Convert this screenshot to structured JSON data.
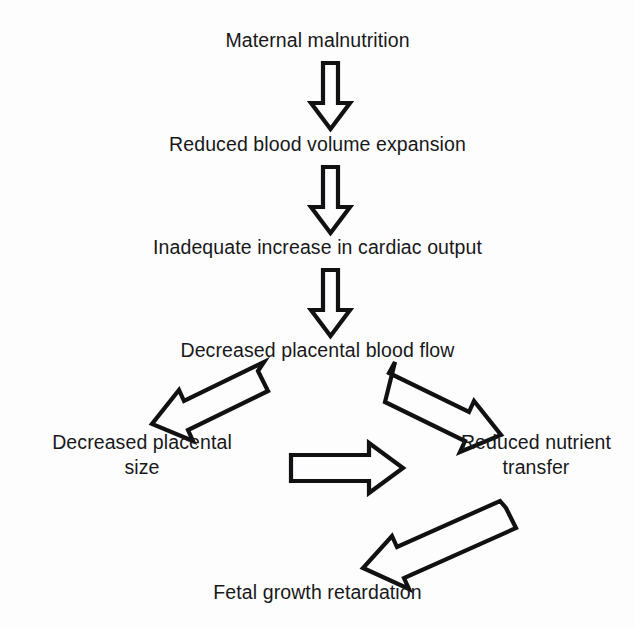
{
  "diagram": {
    "type": "flowchart",
    "background_color": "#fdfdfd",
    "line_color": "#111113",
    "text_color": "#18181a",
    "nodes": [
      {
        "id": "n1",
        "label": "Maternal malnutrition"
      },
      {
        "id": "n2",
        "label": "Reduced blood volume expansion"
      },
      {
        "id": "n3",
        "label": "Inadequate increase in cardiac output"
      },
      {
        "id": "n4",
        "label": "Decreased placental blood flow"
      },
      {
        "id": "n5",
        "label": "Decreased placental\nsize"
      },
      {
        "id": "n6",
        "label": "Reduced nutrient\ntransfer"
      },
      {
        "id": "n7",
        "label": "Fetal growth retardation"
      }
    ],
    "edges": [
      {
        "from": "n1",
        "to": "n2",
        "direction": "down"
      },
      {
        "from": "n2",
        "to": "n3",
        "direction": "down"
      },
      {
        "from": "n3",
        "to": "n4",
        "direction": "down"
      },
      {
        "from": "n4",
        "to": "n5",
        "direction": "down-left"
      },
      {
        "from": "n4",
        "to": "n6",
        "direction": "down-right"
      },
      {
        "from": "n5",
        "to": "n6",
        "direction": "right"
      },
      {
        "from": "n6",
        "to": "n7",
        "direction": "down-left"
      }
    ]
  }
}
